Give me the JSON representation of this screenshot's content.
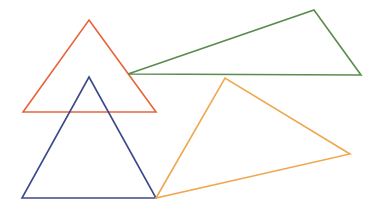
{
  "canvas": {
    "width": 379,
    "height": 215,
    "background": "#ffffff"
  },
  "shapes": [
    {
      "id": "red-triangle",
      "type": "triangle",
      "stroke": "#e8643c",
      "stroke_width": 1.6,
      "points": [
        [
          89,
          20
        ],
        [
          156,
          112
        ],
        [
          23,
          112
        ]
      ]
    },
    {
      "id": "green-triangle",
      "type": "triangle",
      "stroke": "#5a8c4e",
      "stroke_width": 1.6,
      "points": [
        [
          128,
          74
        ],
        [
          314,
          10
        ],
        [
          361,
          75
        ]
      ]
    },
    {
      "id": "blue-triangle",
      "type": "triangle",
      "stroke": "#3c4a8c",
      "stroke_width": 1.6,
      "points": [
        [
          89,
          77
        ],
        [
          156,
          198
        ],
        [
          22,
          198
        ]
      ]
    },
    {
      "id": "orange-triangle",
      "type": "triangle",
      "stroke": "#f0a850",
      "stroke_width": 1.6,
      "points": [
        [
          156,
          198
        ],
        [
          225,
          78
        ],
        [
          350,
          154
        ]
      ]
    }
  ]
}
